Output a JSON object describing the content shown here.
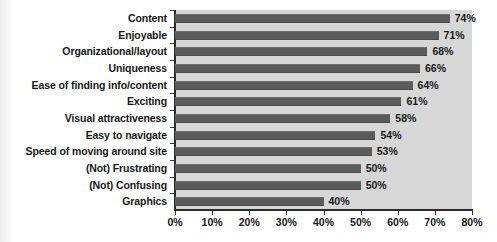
{
  "chart_data": {
    "type": "bar",
    "orientation": "horizontal",
    "title": "",
    "subtitle": "",
    "xlabel": "",
    "ylabel": "",
    "xlim": [
      0,
      80
    ],
    "grid": false,
    "legend": null,
    "legend_position": "none",
    "xticks": [
      "0%",
      "10%",
      "20%",
      "30%",
      "40%",
      "50%",
      "60%",
      "70%",
      "80%"
    ],
    "xtick_values": [
      0,
      10,
      20,
      30,
      40,
      50,
      60,
      70,
      80
    ],
    "value_suffix": "%",
    "categories": [
      "Content",
      "Enjoyable",
      "Organizational/layout",
      "Uniqueness",
      "Ease of finding info/content",
      "Exciting",
      "Visual attractiveness",
      "Easy to navigate",
      "Speed of moving around site",
      "(Not) Frustrating",
      "(Not) Confusing",
      "Graphics"
    ],
    "values": [
      74,
      71,
      68,
      66,
      64,
      61,
      58,
      54,
      53,
      50,
      50,
      40
    ],
    "data_labels": [
      "74%",
      "71%",
      "68%",
      "66%",
      "64%",
      "61%",
      "58%",
      "54%",
      "53%",
      "50%",
      "50%",
      "40%"
    ],
    "colors": {
      "bar": "#5b5b5b",
      "plot_background": "#d7d7d7",
      "page_background": "#ffffff",
      "axis": "#2b2b2b",
      "text": "#161616"
    }
  }
}
